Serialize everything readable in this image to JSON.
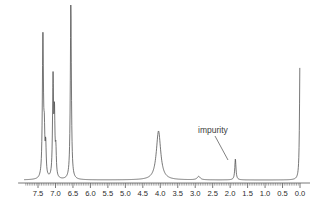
{
  "figure": {
    "kind": "nmr-spectrum",
    "background_color": "#ffffff",
    "trace_color": "#4a4a4a",
    "axis_color": "#555555",
    "label_color": "#2b2b2b"
  },
  "annotations": [
    {
      "id": "impurity",
      "label": "impurity",
      "text_x": 198,
      "text_y": 133,
      "leader_from_x": 215,
      "leader_from_y": 136,
      "leader_to_x": 228,
      "leader_to_y": 160
    }
  ],
  "axis": {
    "label_text": "",
    "direction": "reversed",
    "min": 0.0,
    "max": 7.9,
    "tick_labels": [
      "7.5",
      "7.0",
      "6.5",
      "6.0",
      "5.5",
      "5.0",
      "4.5",
      "4.0",
      "3.5",
      "3.0",
      "2.5",
      "2.0",
      "1.5",
      "1.0",
      "0.5",
      "0.0"
    ],
    "tick_values": [
      7.5,
      7.0,
      6.5,
      6.0,
      5.5,
      5.0,
      4.5,
      4.0,
      3.5,
      3.0,
      2.5,
      2.0,
      1.5,
      1.0,
      0.5,
      0.0
    ],
    "minor_tick_step": 0.05,
    "major_tick_step": 0.5,
    "baseline_y": 180,
    "ruler_y": 183,
    "pixels_per_ppm": 34.93,
    "x_at_zero_ppm": 300.0
  },
  "chart_data": {
    "type": "line",
    "title": "",
    "xlabel": "",
    "ylabel": "",
    "xlim": [
      7.9,
      0.0
    ],
    "ylim": [
      0,
      180
    ],
    "grid": false,
    "legend": "none",
    "series": [
      {
        "name": "1H NMR trace",
        "peaks": [
          {
            "ppm": 7.36,
            "height": 146,
            "width": 0.018,
            "note": "aromatic"
          },
          {
            "ppm": 7.32,
            "height": 38,
            "width": 0.016,
            "note": "aromatic shoulder"
          },
          {
            "ppm": 7.28,
            "height": 30,
            "width": 0.016,
            "note": "aromatic shoulder"
          },
          {
            "ppm": 7.07,
            "height": 98,
            "width": 0.017,
            "note": "aromatic"
          },
          {
            "ppm": 7.03,
            "height": 60,
            "width": 0.016,
            "note": "aromatic"
          },
          {
            "ppm": 6.99,
            "height": 26,
            "width": 0.016,
            "note": "aromatic"
          },
          {
            "ppm": 6.56,
            "height": 176,
            "width": 0.018,
            "note": "tallest vinyl/aromatic"
          },
          {
            "ppm": 4.05,
            "height": 49,
            "width": 0.075,
            "note": "broad methine/methylene"
          },
          {
            "ppm": 2.9,
            "height": 3.5,
            "width": 0.05,
            "note": "trace signal"
          },
          {
            "ppm": 1.85,
            "height": 21,
            "width": 0.02,
            "note": "impurity"
          },
          {
            "ppm": 0.0,
            "height": 126,
            "width": 0.016,
            "note": "TMS reference"
          }
        ]
      }
    ]
  }
}
